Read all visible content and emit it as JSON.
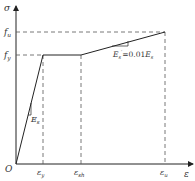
{
  "diagram": {
    "type": "stress-strain-bilinear-hardening",
    "axes": {
      "y_label": "σ",
      "x_label": "ε",
      "origin_label": "O"
    },
    "y_ticks": [
      {
        "label": "f",
        "sub": "u",
        "y": 32
      },
      {
        "label": "f",
        "sub": "y",
        "y": 55
      }
    ],
    "x_ticks": [
      {
        "label": "ε",
        "sub": "y",
        "x": 43
      },
      {
        "label": "ε",
        "sub": "sh",
        "x": 81
      },
      {
        "label": "ε",
        "sub": "u",
        "x": 165
      }
    ],
    "annotations": {
      "elastic_slope": {
        "label": "E",
        "sub": "s"
      },
      "hardening_slope": {
        "label": "E",
        "sub": "s",
        "prime": "′",
        "eq": "=0.01",
        "label2": "E",
        "sub2": "s"
      }
    },
    "colors": {
      "line": "#333333",
      "dash": "#555555"
    }
  }
}
